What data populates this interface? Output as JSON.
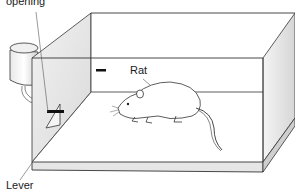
{
  "diagram": {
    "labels": {
      "opening": "opening",
      "rat": "Rat",
      "lever": "Lever"
    }
  }
}
